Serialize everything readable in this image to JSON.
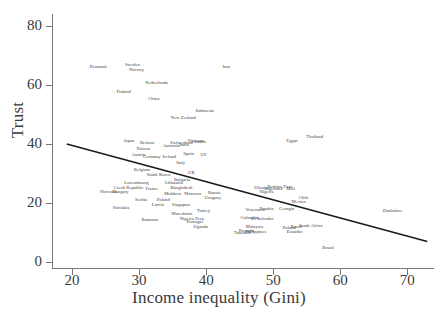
{
  "chart_data": {
    "type": "scatter",
    "title": "",
    "xlabel": "Income inequality (Gini)",
    "ylabel": "Trust",
    "xlim": [
      17,
      74
    ],
    "ylim": [
      -2,
      84
    ],
    "xticks": [
      20,
      30,
      40,
      50,
      60,
      70
    ],
    "yticks": [
      0,
      20,
      40,
      60,
      80
    ],
    "grid": false,
    "legend": null,
    "marker_style": "text-labels-only",
    "trendline": {
      "type": "linear",
      "x_start": 19.2,
      "y_start": 40.0,
      "x_end": 73.0,
      "y_end": 7.0,
      "color": "#1a1a1a"
    },
    "points": [
      {
        "label": "Denmark",
        "x": 23.9,
        "y": 66.5
      },
      {
        "label": "Sweden",
        "x": 29.0,
        "y": 67.0
      },
      {
        "label": "Norway",
        "x": 29.6,
        "y": 65.5
      },
      {
        "label": "Iran",
        "x": 43.0,
        "y": 66.5
      },
      {
        "label": "Netherlands",
        "x": 32.6,
        "y": 61.0
      },
      {
        "label": "Finland",
        "x": 27.7,
        "y": 58.0
      },
      {
        "label": "China",
        "x": 32.2,
        "y": 55.5
      },
      {
        "label": "Indonesia",
        "x": 39.8,
        "y": 51.5
      },
      {
        "label": "New Zealand",
        "x": 36.6,
        "y": 49.0
      },
      {
        "label": "Japan",
        "x": 28.5,
        "y": 41.5
      },
      {
        "label": "Belarus",
        "x": 31.2,
        "y": 40.5
      },
      {
        "label": "Switzerland",
        "x": 36.3,
        "y": 40.8
      },
      {
        "label": "Vietnam",
        "x": 38.4,
        "y": 41.2
      },
      {
        "label": "Canada",
        "x": 38.9,
        "y": 40.9
      },
      {
        "label": "Taiwan",
        "x": 30.6,
        "y": 38.7
      },
      {
        "label": "Australia",
        "x": 34.8,
        "y": 39.8
      },
      {
        "label": "India",
        "x": 36.7,
        "y": 40.0
      },
      {
        "label": "Austria",
        "x": 29.9,
        "y": 36.6
      },
      {
        "label": "Germany",
        "x": 31.9,
        "y": 36.0
      },
      {
        "label": "Ireland",
        "x": 34.5,
        "y": 36.0
      },
      {
        "label": "Spain",
        "x": 37.4,
        "y": 36.8
      },
      {
        "label": "US",
        "x": 39.6,
        "y": 36.6
      },
      {
        "label": "Italy",
        "x": 36.2,
        "y": 33.8
      },
      {
        "label": "Belgium",
        "x": 30.4,
        "y": 31.5
      },
      {
        "label": "South Korea",
        "x": 32.9,
        "y": 29.8
      },
      {
        "label": "UK",
        "x": 37.8,
        "y": 30.5
      },
      {
        "label": "Luxembourg",
        "x": 29.6,
        "y": 27.0
      },
      {
        "label": "Lithuania",
        "x": 35.2,
        "y": 27.0
      },
      {
        "label": "Bulgaria",
        "x": 36.4,
        "y": 28.3
      },
      {
        "label": "Czech Republic",
        "x": 28.4,
        "y": 25.5
      },
      {
        "label": "France",
        "x": 31.9,
        "y": 25.2
      },
      {
        "label": "Bangladesh",
        "x": 36.3,
        "y": 25.5
      },
      {
        "label": "Slovenia",
        "x": 25.4,
        "y": 24.0
      },
      {
        "label": "Hungary",
        "x": 27.2,
        "y": 24.0
      },
      {
        "label": "Moldova",
        "x": 35.0,
        "y": 23.5
      },
      {
        "label": "Morocco",
        "x": 38.0,
        "y": 23.3
      },
      {
        "label": "Russia",
        "x": 41.2,
        "y": 23.9
      },
      {
        "label": "Egypt",
        "x": 52.8,
        "y": 41.3
      },
      {
        "label": "Thailand",
        "x": 56.2,
        "y": 42.8
      },
      {
        "label": "Serbia",
        "x": 30.3,
        "y": 21.2
      },
      {
        "label": "Poland",
        "x": 33.6,
        "y": 21.2
      },
      {
        "label": "Latvia",
        "x": 32.8,
        "y": 19.7
      },
      {
        "label": "Singapore",
        "x": 36.3,
        "y": 19.7
      },
      {
        "label": "Uruguay",
        "x": 41.0,
        "y": 22.2
      },
      {
        "label": "Ukraine",
        "x": 48.3,
        "y": 25.5
      },
      {
        "label": "Burkina Faso",
        "x": 51.0,
        "y": 25.7
      },
      {
        "label": "Argentina",
        "x": 50.0,
        "y": 25.0
      },
      {
        "label": "Mali",
        "x": 52.6,
        "y": 25.2
      },
      {
        "label": "Nigeria",
        "x": 49.0,
        "y": 24.2
      },
      {
        "label": "Chile",
        "x": 54.6,
        "y": 22.0
      },
      {
        "label": "Mexico",
        "x": 53.8,
        "y": 20.6
      },
      {
        "label": "Slovakia",
        "x": 27.3,
        "y": 18.5
      },
      {
        "label": "Turkey",
        "x": 39.6,
        "y": 17.6
      },
      {
        "label": "Venezuela",
        "x": 47.3,
        "y": 18.0
      },
      {
        "label": "Zambia",
        "x": 49.0,
        "y": 18.2
      },
      {
        "label": "Georgia",
        "x": 52.0,
        "y": 18.3
      },
      {
        "label": "Romania",
        "x": 31.6,
        "y": 14.5
      },
      {
        "label": "Macedonia",
        "x": 36.4,
        "y": 16.6
      },
      {
        "label": "Nigeria",
        "x": 37.1,
        "y": 14.8
      },
      {
        "label": "Peru",
        "x": 39.0,
        "y": 14.9
      },
      {
        "label": "Portugal",
        "x": 38.3,
        "y": 13.8
      },
      {
        "label": "Uganda",
        "x": 39.2,
        "y": 12.2
      },
      {
        "label": "Colombia",
        "x": 46.5,
        "y": 15.3
      },
      {
        "label": "El Salvador",
        "x": 48.4,
        "y": 14.8
      },
      {
        "label": "Malaysia",
        "x": 47.2,
        "y": 12.2
      },
      {
        "label": "Philippines",
        "x": 47.4,
        "y": 10.5
      },
      {
        "label": "Tanzania",
        "x": 45.4,
        "y": 10.2
      },
      {
        "label": "Rwanda",
        "x": 46.0,
        "y": 10.8
      },
      {
        "label": "Poland",
        "x": 52.4,
        "y": 12.0
      },
      {
        "label": "Brazil",
        "x": 53.5,
        "y": 12.3
      },
      {
        "label": "South Africa",
        "x": 55.6,
        "y": 12.5
      },
      {
        "label": "Ecuador",
        "x": 53.2,
        "y": 10.5
      },
      {
        "label": "Zimbabwe",
        "x": 67.8,
        "y": 17.5
      },
      {
        "label": "Brazil",
        "x": 58.2,
        "y": 5.0
      }
    ]
  }
}
